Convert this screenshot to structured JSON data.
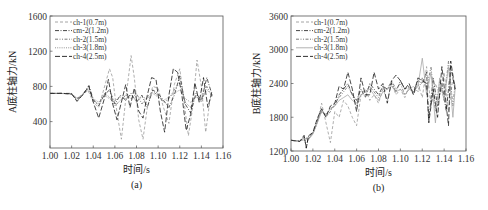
{
  "chart_data": [
    {
      "id": "a",
      "type": "line",
      "caption": "(a)",
      "title": "",
      "xlabel": "时间/s",
      "ylabel": "A底柱轴力/kN",
      "xlim": [
        1.0,
        1.16
      ],
      "ylim": [
        100,
        1600
      ],
      "xticks": [
        1.0,
        1.02,
        1.04,
        1.06,
        1.08,
        1.1,
        1.12,
        1.14,
        1.16
      ],
      "xtick_labels": [
        "1.00",
        "1.02",
        "1.04",
        "1.06",
        "1.08",
        "1.10",
        "1.12",
        "1.14",
        "1.16"
      ],
      "yticks": [
        400,
        800,
        1200,
        1600
      ],
      "ytick_labels": [
        "400",
        "800",
        "1200",
        "1600"
      ],
      "grid": false,
      "legend_position": "upper left",
      "series": [
        {
          "name": "ch-1(0.7m)",
          "style": "dashed",
          "color": "#9a9a9a",
          "x": [
            1.0,
            1.01,
            1.02,
            1.025,
            1.03,
            1.035,
            1.04,
            1.045,
            1.05,
            1.055,
            1.058,
            1.062,
            1.066,
            1.07,
            1.075,
            1.078,
            1.082,
            1.086,
            1.09,
            1.095,
            1.1,
            1.105,
            1.11,
            1.115,
            1.12,
            1.124,
            1.128,
            1.132,
            1.136,
            1.14,
            1.144,
            1.148,
            1.15
          ],
          "y": [
            720,
            720,
            710,
            650,
            700,
            760,
            620,
            560,
            780,
            1000,
            900,
            500,
            200,
            650,
            1150,
            900,
            420,
            200,
            560,
            800,
            780,
            560,
            380,
            820,
            1000,
            620,
            240,
            560,
            1100,
            800,
            280,
            650,
            700
          ]
        },
        {
          "name": "cm-2(1.2m)",
          "style": "dashdot",
          "color": "#303030",
          "x": [
            1.0,
            1.01,
            1.02,
            1.025,
            1.03,
            1.036,
            1.04,
            1.045,
            1.05,
            1.055,
            1.06,
            1.065,
            1.07,
            1.075,
            1.08,
            1.085,
            1.09,
            1.095,
            1.1,
            1.105,
            1.11,
            1.115,
            1.12,
            1.125,
            1.13,
            1.135,
            1.14,
            1.145,
            1.15
          ],
          "y": [
            720,
            720,
            720,
            640,
            700,
            810,
            650,
            580,
            700,
            760,
            600,
            700,
            640,
            720,
            620,
            700,
            560,
            760,
            720,
            640,
            560,
            700,
            920,
            600,
            500,
            720,
            640,
            900,
            700
          ]
        },
        {
          "name": "ch-2(1.5m)",
          "style": "dashdotdot",
          "color": "#6a6a6a",
          "x": [
            1.0,
            1.01,
            1.02,
            1.025,
            1.03,
            1.036,
            1.04,
            1.045,
            1.05,
            1.055,
            1.06,
            1.065,
            1.07,
            1.075,
            1.08,
            1.085,
            1.09,
            1.095,
            1.1,
            1.105,
            1.11,
            1.115,
            1.12,
            1.125,
            1.13,
            1.135,
            1.14,
            1.145,
            1.15
          ],
          "y": [
            720,
            720,
            715,
            660,
            710,
            780,
            640,
            600,
            720,
            680,
            580,
            640,
            700,
            660,
            720,
            600,
            680,
            740,
            700,
            620,
            660,
            760,
            840,
            620,
            560,
            700,
            620,
            800,
            680
          ]
        },
        {
          "name": "ch-3(1.8m)",
          "style": "dotted",
          "color": "#888888",
          "x": [
            1.0,
            1.01,
            1.02,
            1.025,
            1.03,
            1.036,
            1.04,
            1.045,
            1.05,
            1.055,
            1.06,
            1.065,
            1.07,
            1.075,
            1.08,
            1.085,
            1.09,
            1.095,
            1.1,
            1.105,
            1.11,
            1.115,
            1.12,
            1.125,
            1.13,
            1.135,
            1.14,
            1.145,
            1.15
          ],
          "y": [
            720,
            720,
            712,
            670,
            705,
            760,
            660,
            620,
            700,
            660,
            640,
            680,
            660,
            700,
            640,
            680,
            660,
            720,
            680,
            640,
            680,
            720,
            760,
            660,
            620,
            680,
            660,
            760,
            700
          ]
        },
        {
          "name": "ch-4(2.5m)",
          "style": "longdash",
          "color": "#1a1a1a",
          "x": [
            1.0,
            1.01,
            1.02,
            1.025,
            1.03,
            1.036,
            1.04,
            1.045,
            1.05,
            1.054,
            1.058,
            1.062,
            1.066,
            1.07,
            1.074,
            1.078,
            1.082,
            1.086,
            1.09,
            1.094,
            1.098,
            1.102,
            1.106,
            1.11,
            1.114,
            1.118,
            1.122,
            1.126,
            1.13,
            1.134,
            1.138,
            1.142,
            1.146,
            1.15
          ],
          "y": [
            720,
            722,
            715,
            630,
            700,
            800,
            620,
            440,
            650,
            880,
            600,
            420,
            620,
            820,
            560,
            780,
            520,
            440,
            700,
            900,
            880,
            520,
            280,
            700,
            1000,
            960,
            700,
            300,
            480,
            840,
            620,
            900,
            560,
            750
          ]
        }
      ]
    },
    {
      "id": "b",
      "type": "line",
      "caption": "(b)",
      "title": "",
      "xlabel": "时间/s",
      "ylabel": "B底柱轴力/kN",
      "xlim": [
        1.0,
        1.16
      ],
      "ylim": [
        1200,
        3600
      ],
      "xticks": [
        1.0,
        1.02,
        1.04,
        1.06,
        1.08,
        1.1,
        1.12,
        1.14,
        1.16
      ],
      "xtick_labels": [
        "1.00",
        "1.02",
        "1.04",
        "1.06",
        "1.08",
        "1.10",
        "1.12",
        "1.14",
        "1.16"
      ],
      "yticks": [
        1200,
        1800,
        2400,
        3000,
        3600
      ],
      "ytick_labels": [
        "1200",
        "1800",
        "2400",
        "3000",
        "3600"
      ],
      "grid": false,
      "legend_position": "upper left",
      "series": [
        {
          "name": "ch-1(0.7m)",
          "style": "dashed",
          "color": "#9a9a9a",
          "x": [
            1.0,
            1.008,
            1.012,
            1.016,
            1.02,
            1.024,
            1.028,
            1.032,
            1.036,
            1.04,
            1.044,
            1.048,
            1.052,
            1.056,
            1.06,
            1.064,
            1.068,
            1.072,
            1.076,
            1.08,
            1.084,
            1.088,
            1.092,
            1.096,
            1.1,
            1.104,
            1.108,
            1.112,
            1.116,
            1.12,
            1.124,
            1.128,
            1.132,
            1.136,
            1.14,
            1.144,
            1.148,
            1.15
          ],
          "y": [
            1390,
            1380,
            1400,
            1440,
            1500,
            1700,
            2050,
            1700,
            1350,
            1900,
            1800,
            2100,
            2000,
            1800,
            1650,
            2200,
            2300,
            2100,
            2200,
            2050,
            2300,
            2100,
            2400,
            2200,
            2300,
            2150,
            2350,
            2200,
            2400,
            2150,
            2700,
            2000,
            2400,
            2200,
            2600,
            1900,
            2500,
            2300
          ]
        },
        {
          "name": "cm-2(1.2m)",
          "style": "dashdot",
          "color": "#303030",
          "x": [
            1.0,
            1.008,
            1.012,
            1.014,
            1.016,
            1.02,
            1.024,
            1.028,
            1.032,
            1.036,
            1.04,
            1.044,
            1.048,
            1.052,
            1.056,
            1.06,
            1.064,
            1.068,
            1.072,
            1.076,
            1.08,
            1.084,
            1.088,
            1.092,
            1.096,
            1.1,
            1.104,
            1.108,
            1.112,
            1.116,
            1.12,
            1.124,
            1.126,
            1.13,
            1.134,
            1.138,
            1.142,
            1.146,
            1.15
          ],
          "y": [
            1390,
            1370,
            1460,
            1260,
            1460,
            1520,
            1750,
            1900,
            1850,
            1950,
            2000,
            2200,
            2300,
            2400,
            2200,
            2100,
            2300,
            2150,
            2400,
            2300,
            2200,
            2350,
            2300,
            2400,
            2250,
            2450,
            2300,
            2350,
            2250,
            2450,
            2400,
            2600,
            1750,
            2500,
            2000,
            2400,
            1900,
            2700,
            2300
          ]
        },
        {
          "name": "ch-2(1.5m)",
          "style": "dashdotdot",
          "color": "#6a6a6a",
          "x": [
            1.0,
            1.008,
            1.012,
            1.016,
            1.02,
            1.024,
            1.028,
            1.032,
            1.036,
            1.04,
            1.044,
            1.048,
            1.052,
            1.056,
            1.06,
            1.064,
            1.068,
            1.072,
            1.076,
            1.08,
            1.084,
            1.088,
            1.092,
            1.096,
            1.1,
            1.104,
            1.108,
            1.112,
            1.116,
            1.12,
            1.124,
            1.128,
            1.132,
            1.136,
            1.14,
            1.144,
            1.148,
            1.15
          ],
          "y": [
            1390,
            1375,
            1440,
            1420,
            1510,
            1720,
            1950,
            1800,
            1900,
            2050,
            2150,
            2250,
            2350,
            2200,
            2000,
            2200,
            2250,
            2350,
            2250,
            2150,
            2350,
            2300,
            2450,
            2300,
            2400,
            2200,
            2300,
            2350,
            2250,
            2500,
            2300,
            2700,
            1900,
            2450,
            2100,
            2800,
            2000,
            2400
          ]
        },
        {
          "name": "ch-3(1.8m)",
          "style": "solid",
          "color": "#a8a8a8",
          "x": [
            1.0,
            1.008,
            1.012,
            1.016,
            1.02,
            1.024,
            1.028,
            1.032,
            1.036,
            1.04,
            1.044,
            1.048,
            1.052,
            1.056,
            1.06,
            1.064,
            1.068,
            1.072,
            1.076,
            1.08,
            1.084,
            1.088,
            1.092,
            1.096,
            1.1,
            1.104,
            1.108,
            1.112,
            1.116,
            1.12,
            1.124,
            1.128,
            1.132,
            1.136,
            1.14,
            1.144,
            1.148,
            1.15
          ],
          "y": [
            1390,
            1378,
            1430,
            1400,
            1500,
            1700,
            1900,
            1850,
            1950,
            2000,
            2100,
            2150,
            2200,
            2100,
            2050,
            2200,
            2250,
            2300,
            2200,
            2100,
            2250,
            2300,
            2350,
            2250,
            2300,
            2200,
            2300,
            2250,
            2350,
            2850,
            2200,
            2600,
            1700,
            2500,
            2100,
            2700,
            1800,
            2300
          ]
        },
        {
          "name": "ch-4(2.5m)",
          "style": "longdash",
          "color": "#1a1a1a",
          "x": [
            1.0,
            1.008,
            1.012,
            1.014,
            1.016,
            1.02,
            1.024,
            1.028,
            1.032,
            1.036,
            1.04,
            1.044,
            1.048,
            1.052,
            1.056,
            1.06,
            1.064,
            1.068,
            1.072,
            1.076,
            1.08,
            1.084,
            1.088,
            1.092,
            1.096,
            1.1,
            1.104,
            1.108,
            1.112,
            1.116,
            1.12,
            1.124,
            1.126,
            1.13,
            1.134,
            1.138,
            1.142,
            1.144,
            1.146,
            1.15
          ],
          "y": [
            1390,
            1370,
            1480,
            1250,
            1470,
            1530,
            1780,
            1950,
            1800,
            2000,
            2050,
            2350,
            2300,
            2600,
            2300,
            1900,
            2500,
            2200,
            2200,
            2600,
            2300,
            2400,
            2050,
            2450,
            2550,
            2450,
            2300,
            2400,
            2200,
            2500,
            2450,
            2400,
            1700,
            2300,
            1800,
            2700,
            2000,
            1650,
            2800,
            2300
          ]
        }
      ]
    }
  ]
}
